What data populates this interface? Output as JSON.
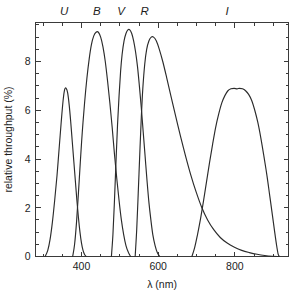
{
  "chart_data": {
    "type": "line",
    "title": "",
    "xlabel": "λ (nm)",
    "ylabel": "relative throughput (%)",
    "xlim": [
      280,
      940
    ],
    "ylim": [
      0,
      9.6
    ],
    "grid": false,
    "legend_position": "above-plot-inline",
    "xticks": [
      400,
      600,
      800
    ],
    "xtick_labels": [
      "400",
      "600",
      "800"
    ],
    "xminor_step": 50,
    "yticks": [
      0,
      2,
      4,
      6,
      8
    ],
    "ytick_labels": [
      "0",
      "2",
      "4",
      "6",
      "8"
    ],
    "yminor_step": 0.5,
    "band_labels": [
      {
        "name": "U",
        "x": 355
      },
      {
        "name": "B",
        "x": 440
      },
      {
        "name": "V",
        "x": 503
      },
      {
        "name": "R",
        "x": 565
      },
      {
        "name": "I",
        "x": 780
      }
    ],
    "series": [
      {
        "name": "U",
        "peak_value": 6.9,
        "peak_wavelength": 355,
        "points": [
          [
            305,
            0.0
          ],
          [
            312,
            0.25
          ],
          [
            318,
            0.7
          ],
          [
            324,
            1.4
          ],
          [
            330,
            2.3
          ],
          [
            336,
            3.3
          ],
          [
            342,
            4.5
          ],
          [
            347,
            5.5
          ],
          [
            352,
            6.4
          ],
          [
            356,
            6.85
          ],
          [
            360,
            6.9
          ],
          [
            364,
            6.7
          ],
          [
            368,
            6.2
          ],
          [
            372,
            5.5
          ],
          [
            376,
            4.7
          ],
          [
            380,
            3.9
          ],
          [
            384,
            3.1
          ],
          [
            388,
            2.3
          ],
          [
            392,
            1.6
          ],
          [
            396,
            1.0
          ],
          [
            400,
            0.55
          ],
          [
            404,
            0.25
          ],
          [
            408,
            0.08
          ],
          [
            412,
            0.0
          ]
        ]
      },
      {
        "name": "B",
        "peak_value": 9.2,
        "peak_wavelength": 440,
        "points": [
          [
            377,
            0.0
          ],
          [
            382,
            0.5
          ],
          [
            387,
            1.4
          ],
          [
            392,
            2.6
          ],
          [
            397,
            3.9
          ],
          [
            402,
            5.1
          ],
          [
            408,
            6.3
          ],
          [
            414,
            7.3
          ],
          [
            420,
            8.1
          ],
          [
            426,
            8.7
          ],
          [
            432,
            9.05
          ],
          [
            438,
            9.2
          ],
          [
            444,
            9.2
          ],
          [
            450,
            9.0
          ],
          [
            456,
            8.6
          ],
          [
            462,
            8.0
          ],
          [
            468,
            7.2
          ],
          [
            474,
            6.3
          ],
          [
            480,
            5.3
          ],
          [
            486,
            4.2
          ],
          [
            492,
            3.2
          ],
          [
            498,
            2.3
          ],
          [
            504,
            1.5
          ],
          [
            510,
            0.9
          ],
          [
            516,
            0.45
          ],
          [
            522,
            0.18
          ],
          [
            528,
            0.0
          ]
        ]
      },
      {
        "name": "V",
        "peak_value": 9.3,
        "peak_wavelength": 525,
        "points": [
          [
            478,
            0.0
          ],
          [
            482,
            0.9
          ],
          [
            486,
            2.3
          ],
          [
            490,
            3.9
          ],
          [
            494,
            5.4
          ],
          [
            498,
            6.6
          ],
          [
            502,
            7.6
          ],
          [
            506,
            8.3
          ],
          [
            511,
            8.85
          ],
          [
            516,
            9.15
          ],
          [
            521,
            9.3
          ],
          [
            526,
            9.3
          ],
          [
            531,
            9.15
          ],
          [
            536,
            8.85
          ],
          [
            541,
            8.4
          ],
          [
            546,
            7.8
          ],
          [
            551,
            7.0
          ],
          [
            556,
            6.1
          ],
          [
            561,
            5.1
          ],
          [
            566,
            4.1
          ],
          [
            571,
            3.1
          ],
          [
            576,
            2.2
          ],
          [
            581,
            1.5
          ],
          [
            586,
            0.9
          ],
          [
            592,
            0.45
          ],
          [
            598,
            0.15
          ],
          [
            604,
            0.0
          ]
        ]
      },
      {
        "name": "R",
        "peak_value": 9.0,
        "peak_wavelength": 585,
        "points": [
          [
            540,
            0.0
          ],
          [
            544,
            1.1
          ],
          [
            548,
            2.6
          ],
          [
            552,
            4.2
          ],
          [
            556,
            5.7
          ],
          [
            560,
            6.9
          ],
          [
            565,
            7.9
          ],
          [
            570,
            8.5
          ],
          [
            576,
            8.85
          ],
          [
            582,
            9.0
          ],
          [
            588,
            9.0
          ],
          [
            595,
            8.85
          ],
          [
            603,
            8.5
          ],
          [
            612,
            8.0
          ],
          [
            622,
            7.35
          ],
          [
            633,
            6.6
          ],
          [
            645,
            5.8
          ],
          [
            658,
            4.95
          ],
          [
            671,
            4.15
          ],
          [
            685,
            3.35
          ],
          [
            699,
            2.65
          ],
          [
            714,
            2.0
          ],
          [
            729,
            1.5
          ],
          [
            745,
            1.1
          ],
          [
            762,
            0.78
          ],
          [
            780,
            0.55
          ],
          [
            799,
            0.38
          ],
          [
            818,
            0.25
          ],
          [
            838,
            0.16
          ],
          [
            858,
            0.09
          ],
          [
            878,
            0.04
          ],
          [
            898,
            0.01
          ],
          [
            915,
            0.0
          ]
        ]
      },
      {
        "name": "I",
        "peak_value": 6.9,
        "peak_wavelength": 810,
        "points": [
          [
            688,
            0.0
          ],
          [
            695,
            0.35
          ],
          [
            702,
            0.85
          ],
          [
            710,
            1.5
          ],
          [
            718,
            2.25
          ],
          [
            726,
            3.05
          ],
          [
            734,
            3.85
          ],
          [
            742,
            4.6
          ],
          [
            750,
            5.3
          ],
          [
            758,
            5.85
          ],
          [
            766,
            6.3
          ],
          [
            774,
            6.6
          ],
          [
            782,
            6.8
          ],
          [
            790,
            6.88
          ],
          [
            798,
            6.9
          ],
          [
            806,
            6.88
          ],
          [
            812,
            6.9
          ],
          [
            820,
            6.88
          ],
          [
            828,
            6.8
          ],
          [
            836,
            6.65
          ],
          [
            844,
            6.4
          ],
          [
            852,
            6.0
          ],
          [
            860,
            5.5
          ],
          [
            868,
            4.85
          ],
          [
            876,
            4.1
          ],
          [
            884,
            3.3
          ],
          [
            891,
            2.5
          ],
          [
            898,
            1.7
          ],
          [
            904,
            1.0
          ],
          [
            909,
            0.45
          ],
          [
            913,
            0.1
          ],
          [
            916,
            0.0
          ]
        ]
      }
    ]
  }
}
